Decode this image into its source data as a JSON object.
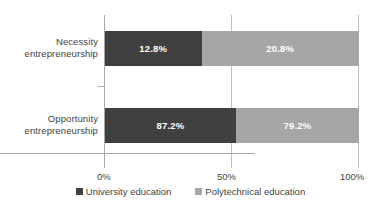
{
  "chart_data": {
    "type": "bar",
    "subtype": "stacked-horizontal-100pct",
    "title": "",
    "subtitle": "",
    "xlabel": "",
    "ylabel": "",
    "categories": [
      "Necessity entrepreneurship",
      "Opportunity entrepreneurship"
    ],
    "category_lines": [
      [
        "Necessity",
        "entrepreneurship"
      ],
      [
        "Opportunity",
        "entrepreneurship"
      ]
    ],
    "series": [
      {
        "name": "University education",
        "color": "#404040",
        "values": [
          12.8,
          87.2
        ],
        "labels": [
          "12.8%",
          "87.2%"
        ]
      },
      {
        "name": "Polytechnical education",
        "color": "#a6a6a6",
        "values": [
          20.8,
          79.2
        ],
        "labels": [
          "20.8%",
          "79.2%"
        ]
      }
    ],
    "bar_segment_widths_pct": [
      [
        38.0,
        62.0
      ],
      [
        51.5,
        48.5
      ]
    ],
    "xlim": [
      0,
      100
    ],
    "xticks": [
      0,
      50,
      100
    ],
    "xtick_labels": [
      "0%",
      "50%",
      "100%"
    ],
    "grid": true,
    "grid_axis": "x",
    "legend_position": "bottom"
  },
  "axis": {
    "ticks": [
      {
        "label": "0%"
      },
      {
        "label": "50%"
      },
      {
        "label": "100%"
      }
    ]
  },
  "legend": {
    "items": [
      {
        "label": "University education",
        "color": "#404040",
        "swatch_icon": "square-swatch-dark"
      },
      {
        "label": "Polytechnical education",
        "color": "#a6a6a6",
        "swatch_icon": "square-swatch-light"
      }
    ]
  }
}
